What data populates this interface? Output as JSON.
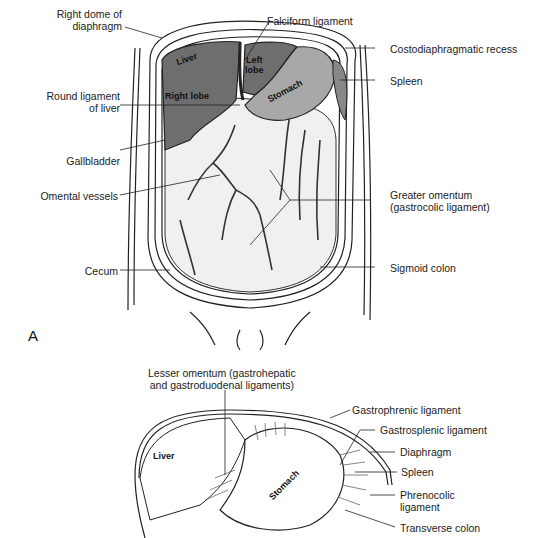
{
  "figure": {
    "panel_a": {
      "letter": "A",
      "left_labels": [
        {
          "id": "right-dome",
          "text": "Right dome of\ndiaphragm"
        },
        {
          "id": "round-ligament",
          "text": "Round ligament\nof liver"
        },
        {
          "id": "gallbladder",
          "text": "Gallbladder"
        },
        {
          "id": "omental-vessels",
          "text": "Omental vessels"
        },
        {
          "id": "cecum",
          "text": "Cecum"
        }
      ],
      "right_labels": [
        {
          "id": "falciform",
          "text": "Falciform ligament"
        },
        {
          "id": "costodiaphragmatic",
          "text": "Costodiaphragmatic recess"
        },
        {
          "id": "spleen",
          "text": "Spleen"
        },
        {
          "id": "greater-omentum",
          "text": "Greater omentum\n(gastrocolic ligament)"
        },
        {
          "id": "sigmoid",
          "text": "Sigmoid colon"
        }
      ],
      "inner_labels": {
        "liver": "Liver",
        "left_lobe": "Left\nlobe",
        "right_lobe": "Right lobe",
        "stomach": "Stomach"
      }
    },
    "panel_b": {
      "labels": [
        {
          "id": "lesser-omentum",
          "text": "Lesser omentum (gastrohepatic\nand gastroduodenal ligaments)"
        },
        {
          "id": "gastrophrenic",
          "text": "Gastrophrenic ligament"
        },
        {
          "id": "gastrosplenic",
          "text": "Gastrosplenic ligament"
        },
        {
          "id": "diaphragm",
          "text": "Diaphragm"
        },
        {
          "id": "spleen-b",
          "text": "Spleen"
        },
        {
          "id": "phrenocolic",
          "text": "Phrenocolic\nligament"
        },
        {
          "id": "transverse-colon",
          "text": "Transverse colon"
        }
      ],
      "inner_labels": {
        "liver": "Liver",
        "stomach": "Stomach"
      }
    },
    "colors": {
      "liver": "#6e6e6e",
      "stomach": "#a8a8a8",
      "omentum": "#f2f2f2",
      "line": "#222222"
    }
  }
}
